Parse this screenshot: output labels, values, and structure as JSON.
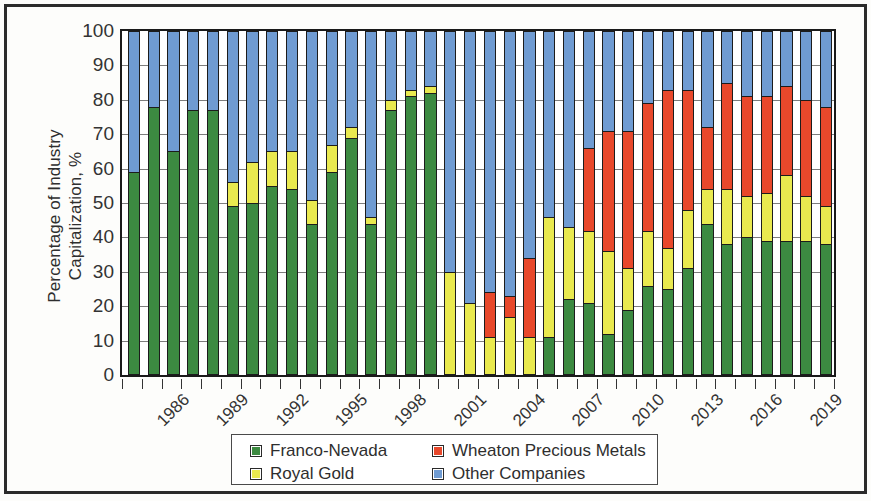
{
  "chart_data": {
    "type": "bar",
    "subtype": "100% stacked column",
    "title": "",
    "xlabel": "",
    "ylabel": "Percentage of Industry Capitalization, %",
    "ylim": [
      0,
      100
    ],
    "yticks": [
      0,
      10,
      20,
      30,
      40,
      50,
      60,
      70,
      80,
      90,
      100
    ],
    "grid": true,
    "legend_position": "bottom",
    "categories": [
      "1986",
      "1987",
      "1988",
      "1989",
      "1990",
      "1991",
      "1992",
      "1993",
      "1994",
      "1995",
      "1996",
      "1997",
      "1998",
      "1999",
      "2000",
      "2001",
      "2002",
      "2003",
      "2004",
      "2005",
      "2006",
      "2007",
      "2008",
      "2009",
      "2010",
      "2011",
      "2012",
      "2013",
      "2014",
      "2015",
      "2016",
      "2017",
      "2018",
      "2019",
      "2020",
      "2021"
    ],
    "tick_labels": [
      "1986",
      "",
      "",
      "1989",
      "",
      "",
      "1992",
      "",
      "",
      "1995",
      "",
      "",
      "1998",
      "",
      "",
      "2001",
      "",
      "",
      "2004",
      "",
      "",
      "2007",
      "",
      "",
      "2010",
      "",
      "",
      "2013",
      "",
      "",
      "2016",
      "",
      "",
      "2019",
      "",
      ""
    ],
    "series": [
      {
        "name": "Franco-Nevada",
        "color": "#3c8a41",
        "values": [
          59,
          78,
          65,
          77,
          77,
          49,
          50,
          55,
          54,
          44,
          59,
          69,
          44,
          77,
          81,
          82,
          0,
          0,
          0,
          0,
          0,
          11,
          22,
          21,
          12,
          19,
          26,
          25,
          31,
          44,
          38,
          40,
          39,
          39,
          39,
          38
        ]
      },
      {
        "name": "Royal Gold",
        "color": "#e9e94f",
        "values": [
          0,
          0,
          0,
          0,
          0,
          7,
          12,
          10,
          11,
          7,
          8,
          3,
          2,
          3,
          2,
          2,
          30,
          21,
          11,
          17,
          11,
          35,
          21,
          21,
          24,
          12,
          16,
          12,
          17,
          10,
          16,
          12,
          14,
          19,
          13,
          11
        ]
      },
      {
        "name": "Wheaton Precious Metals",
        "color": "#e8482b",
        "values": [
          0,
          0,
          0,
          0,
          0,
          0,
          0,
          0,
          0,
          0,
          0,
          0,
          0,
          0,
          0,
          0,
          0,
          0,
          13,
          6,
          23,
          0,
          0,
          24,
          35,
          40,
          37,
          46,
          35,
          18,
          31,
          29,
          28,
          26,
          28,
          29
        ]
      },
      {
        "name": "Other Companies",
        "color": "#6f9bd2",
        "values": [
          41,
          22,
          35,
          23,
          23,
          44,
          38,
          35,
          35,
          49,
          33,
          28,
          54,
          20,
          17,
          16,
          70,
          79,
          76,
          77,
          66,
          54,
          57,
          34,
          29,
          29,
          21,
          17,
          17,
          28,
          15,
          19,
          19,
          16,
          20,
          22
        ]
      }
    ]
  },
  "legend": {
    "items": [
      {
        "label": "Franco-Nevada",
        "color": "#3c8a41"
      },
      {
        "label": "Wheaton Precious Metals",
        "color": "#e8482b"
      },
      {
        "label": "Royal Gold",
        "color": "#e9e94f"
      },
      {
        "label": "Other Companies",
        "color": "#6f9bd2"
      }
    ]
  },
  "axis": {
    "y_title_line1": "Percentage of Industry",
    "y_title_line2": "Capitalization, %"
  }
}
